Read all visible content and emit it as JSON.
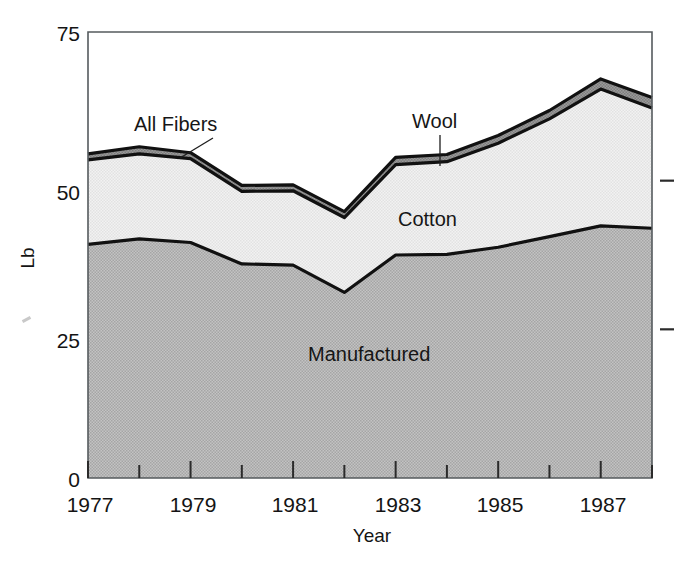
{
  "figure": {
    "background": "#ffffff",
    "plot_area": {
      "left": 88,
      "top": 32,
      "right": 652,
      "bottom": 478
    }
  },
  "axes": {
    "y_title": "Lb",
    "x_title": "Year",
    "y_ticks": [
      "75",
      "50",
      "25",
      "0"
    ],
    "x_ticks": [
      "1977",
      "1979",
      "1981",
      "1983",
      "1985",
      "1987"
    ]
  },
  "labels": {
    "all_fibers": "All Fibers",
    "wool": "Wool",
    "cotton": "Cotton",
    "manufactured": "Manufactured"
  },
  "colors": {
    "manufactured_fill": "#b6b6b6",
    "cotton_fill": "#ececec",
    "wool_fill": "#8e8e8e",
    "outline": "#111111",
    "axis": "#555b5e",
    "text": "#141414"
  },
  "chart_data": {
    "type": "area",
    "title": "",
    "subtitle": "",
    "xlabel": "Year",
    "ylabel": "Lb",
    "stacked": true,
    "grid": false,
    "legend_position": "inline-annotations",
    "xlim": [
      1977,
      1988
    ],
    "ylim": [
      0,
      75
    ],
    "x": [
      1977,
      1978,
      1979,
      1980,
      1981,
      1982,
      1983,
      1984,
      1985,
      1986,
      1987,
      1988
    ],
    "x_tick_values": [
      1977,
      1979,
      1981,
      1983,
      1985,
      1987
    ],
    "y_tick_values": [
      0,
      25,
      50,
      75
    ],
    "series": [
      {
        "name": "Manufactured",
        "values": [
          39.3,
          40.2,
          39.6,
          36.0,
          35.8,
          31.2,
          37.5,
          37.6,
          38.8,
          40.6,
          42.4,
          42.0
        ]
      },
      {
        "name": "Cotton",
        "values": [
          14.2,
          14.3,
          14.1,
          12.2,
          12.5,
          12.6,
          15.2,
          15.6,
          17.5,
          19.8,
          23.0,
          20.2
        ]
      },
      {
        "name": "Wool",
        "values": [
          1.0,
          1.2,
          1.0,
          1.0,
          1.0,
          1.0,
          1.2,
          1.2,
          1.3,
          1.4,
          1.7,
          1.8
        ]
      }
    ],
    "cumulative": {
      "manufactured_top": [
        39.3,
        40.2,
        39.6,
        36.0,
        35.8,
        31.2,
        37.5,
        37.6,
        38.8,
        40.6,
        42.4,
        42.0
      ],
      "cotton_top": [
        53.5,
        54.5,
        53.7,
        48.2,
        48.3,
        43.8,
        52.7,
        53.2,
        56.3,
        60.4,
        65.4,
        62.2
      ],
      "all_fibers_top": [
        54.5,
        55.7,
        54.7,
        49.2,
        49.3,
        44.8,
        53.9,
        54.4,
        57.6,
        61.8,
        67.1,
        64.0
      ]
    },
    "annotations": [
      {
        "text": "All Fibers",
        "x": 1977.9,
        "y": 61.5
      },
      {
        "text": "Wool",
        "x": 1983.5,
        "y": 61.5
      },
      {
        "text": "Cotton",
        "x": 1983.1,
        "y": 47.0
      },
      {
        "text": "Manufactured",
        "x": 1982.1,
        "y": 22.0
      }
    ]
  }
}
